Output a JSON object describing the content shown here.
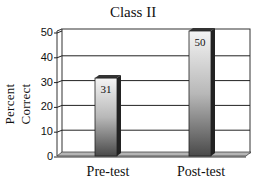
{
  "chart_data": {
    "type": "bar",
    "title": "Class II",
    "xlabel": "",
    "ylabel": "Percent Correct",
    "categories": [
      "Pre-test",
      "Post-test"
    ],
    "values": [
      31,
      50
    ],
    "data_labels": [
      "31",
      "50"
    ],
    "ylim": [
      0,
      50
    ],
    "yticks": [
      "0",
      "10",
      "20",
      "30",
      "40",
      "50"
    ],
    "grid": true,
    "legend": null,
    "style": "3D bars with gray gradient"
  },
  "colors": {
    "bar_light": "#f2f2f2",
    "bar_dark": "#555555",
    "bar_side": "#222222",
    "floor": "#b0b0b0",
    "gridline": "#222222"
  }
}
